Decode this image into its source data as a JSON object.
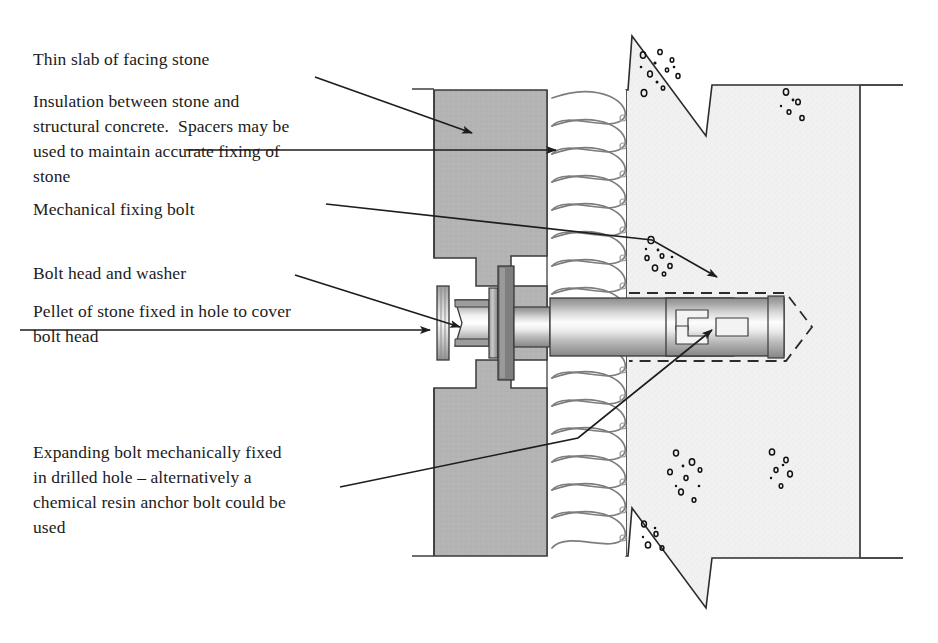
{
  "document": {
    "title": "Stone cladding mechanical fixing — section detail",
    "type": "technical-section-diagram"
  },
  "labels": [
    {
      "id": "facing-stone",
      "text": "Thin slab of facing stone",
      "x": 33,
      "y": 47
    },
    {
      "id": "insulation",
      "text": "Insulation between stone and\nstructural concrete.  Spacers may be\nused to maintain accurate fixing of\nstone",
      "x": 33,
      "y": 89
    },
    {
      "id": "fixing-bolt",
      "text": "Mechanical fixing bolt",
      "x": 33,
      "y": 197
    },
    {
      "id": "bolt-head-washer",
      "text": "Bolt head and washer",
      "x": 33,
      "y": 261
    },
    {
      "id": "stone-pellet",
      "text": "Pellet of stone fixed in hole to cover\nbolt head",
      "x": 33,
      "y": 299
    },
    {
      "id": "expanding-bolt",
      "text": "Expanding bolt mechanically fixed\nin drilled hole – alternatively a\nchemical resin anchor bolt could be\nused",
      "x": 33,
      "y": 440
    }
  ],
  "layers": [
    {
      "id": "facing-stone-layer",
      "name": "Thin slab of facing stone",
      "fill": "#b3b3b3",
      "x_start": 434,
      "x_end": 547
    },
    {
      "id": "insulation-layer",
      "name": "Insulation",
      "fill": "#ffffff",
      "x_start": 547,
      "x_end": 626
    },
    {
      "id": "structural-concrete-layer",
      "name": "Structural concrete",
      "fill": "#f0f0f0",
      "x_start": 626,
      "x_end": 860
    }
  ],
  "components": [
    {
      "id": "stone-pellet",
      "name": "Pellet of stone fixed in hole to cover bolt head"
    },
    {
      "id": "bolt-head",
      "name": "Bolt head"
    },
    {
      "id": "washer",
      "name": "Washer"
    },
    {
      "id": "bolt-shank",
      "name": "Mechanical fixing bolt shank"
    },
    {
      "id": "expansion-sleeve",
      "name": "Expanding bolt sleeve"
    },
    {
      "id": "drilled-hole",
      "name": "Drilled hole outline"
    }
  ],
  "colors": {
    "stone_fill": "#b3b3b3",
    "concrete_fill": "#f0f0f0",
    "metal_light": "#fbfbfb",
    "metal_mid": "#b8b8b8",
    "metal_dark": "#8f8f8f",
    "line": "#2b2b2b",
    "insulation_line": "#7a7a7a",
    "text": "#1b1b1b",
    "background": "#ffffff"
  },
  "leaders": [
    {
      "id": "leader-facing-stone",
      "from_label": "facing-stone",
      "points": "315,77 472,133"
    },
    {
      "id": "leader-insulation",
      "from_label": "insulation",
      "points": "186,150 556,150"
    },
    {
      "id": "leader-fixing-bolt",
      "from_label": "fixing-bolt",
      "points": "326,204 652,240 717,277"
    },
    {
      "id": "leader-bolt-head",
      "from_label": "bolt-head-washer",
      "points": "295,275 460,327"
    },
    {
      "id": "leader-stone-pellet",
      "from_label": "stone-pellet",
      "points": "20,330 130,330 430,330"
    },
    {
      "id": "leader-expanding-bolt",
      "from_label": "expanding-bolt",
      "points": "340,487 578,438 712,330"
    }
  ]
}
